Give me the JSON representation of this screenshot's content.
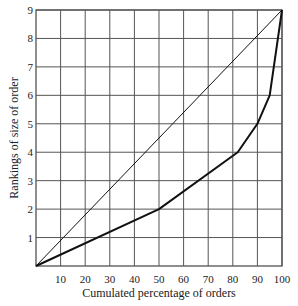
{
  "chart_data": {
    "type": "line",
    "title": "",
    "xlabel": "Cumulated percentage of orders",
    "ylabel": "Rankings of size of order",
    "xlim": [
      0,
      100
    ],
    "ylim": [
      0,
      9
    ],
    "xticks": [
      10,
      20,
      30,
      40,
      50,
      60,
      70,
      80,
      90,
      100
    ],
    "yticks": [
      1,
      2,
      3,
      4,
      5,
      6,
      7,
      8,
      9
    ],
    "grid": true,
    "legend": null,
    "series": [
      {
        "name": "Equal distribution line",
        "style": "thin",
        "x": [
          0,
          100
        ],
        "y": [
          0,
          9
        ]
      },
      {
        "name": "Actual distribution curve",
        "style": "thick",
        "x": [
          0,
          50,
          82,
          90,
          95,
          100
        ],
        "y": [
          0,
          2,
          4,
          5,
          6,
          9
        ]
      }
    ]
  },
  "labels": {
    "xlabel": "Cumulated percentage of orders",
    "ylabel": "Rankings of size of order"
  }
}
